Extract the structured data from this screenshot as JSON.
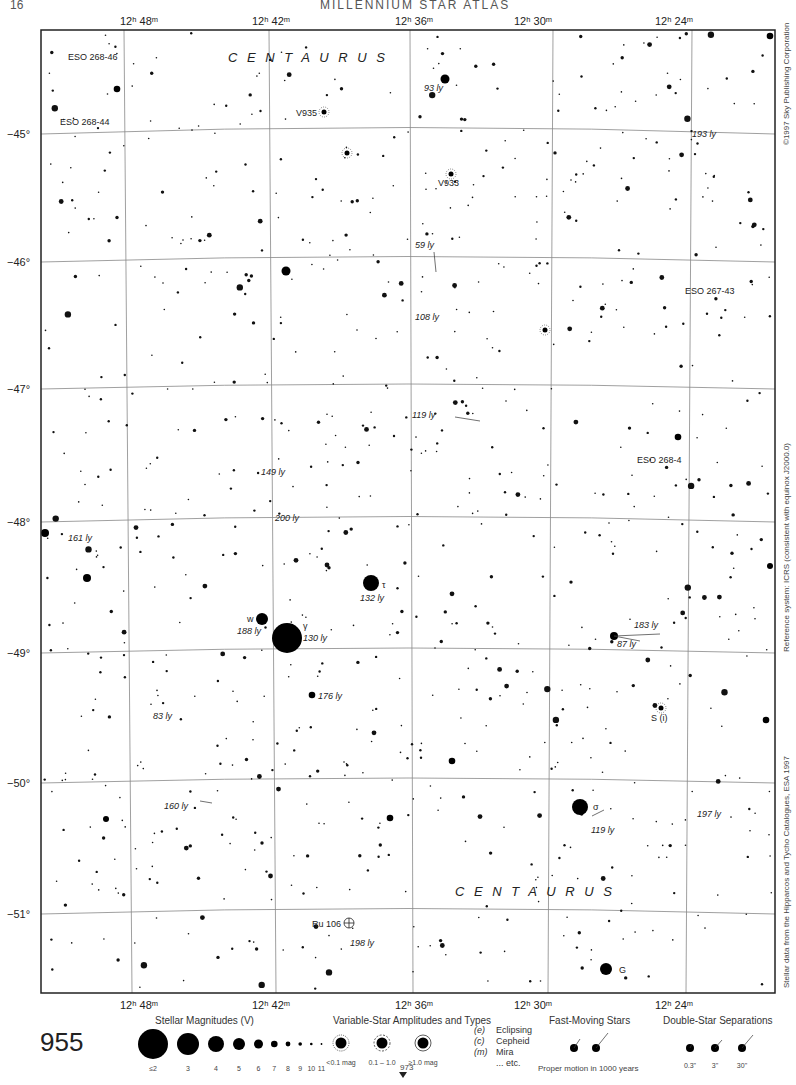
{
  "running_head": {
    "left": "16",
    "right": "MILLENNIUM STAR ATLAS"
  },
  "page_number": "955",
  "continuation_page": "973",
  "constellation_labels": [
    {
      "text": "C E N T A U R U S",
      "x": 228,
      "y": 62
    },
    {
      "text": "C E N T A U R U S",
      "x": 455,
      "y": 896
    }
  ],
  "ra_labels": [
    {
      "text": "12ʰ 48ᵐ",
      "x": 120
    },
    {
      "text": "12ʰ 42ᵐ",
      "x": 252
    },
    {
      "text": "12ʰ 36ᵐ",
      "x": 395
    },
    {
      "text": "12ʰ 30ᵐ",
      "x": 514
    },
    {
      "text": "12ʰ 24ᵐ",
      "x": 655
    }
  ],
  "dec_labels": [
    {
      "text": "−45°",
      "y": 134
    },
    {
      "text": "−46°",
      "y": 262
    },
    {
      "text": "−47°",
      "y": 389
    },
    {
      "text": "−48°",
      "y": 522
    },
    {
      "text": "−49°",
      "y": 653
    },
    {
      "text": "−50°",
      "y": 783
    },
    {
      "text": "−51°",
      "y": 914
    }
  ],
  "side_credits": {
    "copyright": "©1997 Sky Publishing Corporation",
    "reference": "Reference system: ICRS (consistent with equinox J2000.0)",
    "source": "Stellar data from the Hipparcos and Tycho Catalogues, ESA 1997"
  },
  "object_labels": [
    {
      "text": "ESO 268-46",
      "x": 68,
      "y": 60,
      "italic": false
    },
    {
      "text": "ESO 268-44",
      "x": 60,
      "y": 125,
      "italic": false
    },
    {
      "text": "V935",
      "x": 296,
      "y": 116,
      "italic": false
    },
    {
      "text": "V933",
      "x": 438,
      "y": 186,
      "italic": false
    },
    {
      "text": "93 ly",
      "x": 424,
      "y": 91,
      "italic": true
    },
    {
      "text": "193 ly",
      "x": 692,
      "y": 137,
      "italic": true
    },
    {
      "text": "59 ly",
      "x": 415,
      "y": 248,
      "italic": true
    },
    {
      "text": "ESO 267-43",
      "x": 685,
      "y": 294,
      "italic": false
    },
    {
      "text": "108 ly",
      "x": 415,
      "y": 320,
      "italic": true
    },
    {
      "text": "119 ly",
      "x": 412,
      "y": 418,
      "italic": true
    },
    {
      "text": "149 ly",
      "x": 261,
      "y": 475,
      "italic": true
    },
    {
      "text": "ESO 268-4",
      "x": 637,
      "y": 463,
      "italic": false
    },
    {
      "text": "200 ly",
      "x": 275,
      "y": 521,
      "italic": true
    },
    {
      "text": "161 ly",
      "x": 68,
      "y": 541,
      "italic": true
    },
    {
      "text": "τ",
      "x": 382,
      "y": 588,
      "italic": false
    },
    {
      "text": "132 ly",
      "x": 360,
      "y": 601,
      "italic": true
    },
    {
      "text": "w",
      "x": 247,
      "y": 622,
      "italic": false
    },
    {
      "text": "188 ly",
      "x": 237,
      "y": 634,
      "italic": true
    },
    {
      "text": "γ",
      "x": 303,
      "y": 629,
      "italic": false
    },
    {
      "text": "130 ly",
      "x": 303,
      "y": 641,
      "italic": true
    },
    {
      "text": "183 ly",
      "x": 634,
      "y": 628,
      "italic": true
    },
    {
      "text": "87 ly",
      "x": 617,
      "y": 647,
      "italic": true
    },
    {
      "text": "176 ly",
      "x": 318,
      "y": 699,
      "italic": true
    },
    {
      "text": "83 ly",
      "x": 153,
      "y": 719,
      "italic": true
    },
    {
      "text": "S (i)",
      "x": 651,
      "y": 721,
      "italic": false
    },
    {
      "text": "σ",
      "x": 593,
      "y": 810,
      "italic": false
    },
    {
      "text": "160 ly",
      "x": 164,
      "y": 809,
      "italic": true
    },
    {
      "text": "119 ly",
      "x": 591,
      "y": 833,
      "italic": true
    },
    {
      "text": "197 ly",
      "x": 697,
      "y": 817,
      "italic": true
    },
    {
      "text": "Ru 106",
      "x": 312,
      "y": 927,
      "italic": false
    },
    {
      "text": "198 ly",
      "x": 350,
      "y": 946,
      "italic": true
    },
    {
      "text": "G",
      "x": 619,
      "y": 973,
      "italic": false
    }
  ],
  "legend": {
    "magnitudes": {
      "title": "Stellar Magnitudes (V)",
      "items": [
        {
          "label": "≤2",
          "r": 15
        },
        {
          "label": "3",
          "r": 11
        },
        {
          "label": "4",
          "r": 8
        },
        {
          "label": "5",
          "r": 6
        },
        {
          "label": "6",
          "r": 4.5
        },
        {
          "label": "7",
          "r": 3.3
        },
        {
          "label": "8",
          "r": 2.4
        },
        {
          "label": "9",
          "r": 1.8
        },
        {
          "label": "10",
          "r": 1.3
        },
        {
          "label": "11",
          "r": 0.9
        }
      ]
    },
    "variables": {
      "title": "Variable-Star Amplitudes and Types",
      "items": [
        {
          "label": "<0.1 mag"
        },
        {
          "label": "0.1 – 1.0"
        },
        {
          "label": "≥1.0 mag"
        }
      ],
      "types": [
        {
          "code": "(e)",
          "name": "Eclipsing"
        },
        {
          "code": "(c)",
          "name": "Cepheid"
        },
        {
          "code": "(m)",
          "name": "Mira"
        },
        {
          "code": "",
          "name": "... etc."
        }
      ]
    },
    "fast_moving": {
      "title": "Fast-Moving Stars",
      "caption": "Proper motion in 1000 years"
    },
    "doubles": {
      "title": "Double-Star Separations",
      "items": [
        {
          "label": "0.3\""
        },
        {
          "label": "3\""
        },
        {
          "label": "30\""
        }
      ]
    }
  },
  "chart_data": {
    "type": "star_chart",
    "constellation": "Centaurus",
    "ra_ticks": [
      "12h 48m",
      "12h 42m",
      "12h 36m",
      "12h 30m",
      "12h 24m"
    ],
    "dec_ticks": [
      "-45°",
      "-46°",
      "-47°",
      "-48°",
      "-49°",
      "-50°",
      "-51°"
    ],
    "named_stars": [
      {
        "name": "γ Cen",
        "x": 287,
        "y": 638,
        "mag": 2,
        "distance": "130 ly"
      },
      {
        "name": "τ Cen",
        "x": 371,
        "y": 583,
        "mag": 4,
        "distance": "132 ly"
      },
      {
        "name": "w Cen",
        "x": 262,
        "y": 619,
        "mag": 5,
        "distance": "188 ly"
      },
      {
        "name": "σ Cen",
        "x": 580,
        "y": 807,
        "mag": 4,
        "distance": "—"
      },
      {
        "name": "G Cen",
        "x": 606,
        "y": 969,
        "mag": 5,
        "distance": "—"
      }
    ],
    "variables": [
      "V935",
      "V933",
      "S (i)"
    ],
    "deep_sky": [
      "ESO 268-46",
      "ESO 268-44",
      "ESO 267-43",
      "ESO 268-4",
      "Ru 106"
    ]
  }
}
